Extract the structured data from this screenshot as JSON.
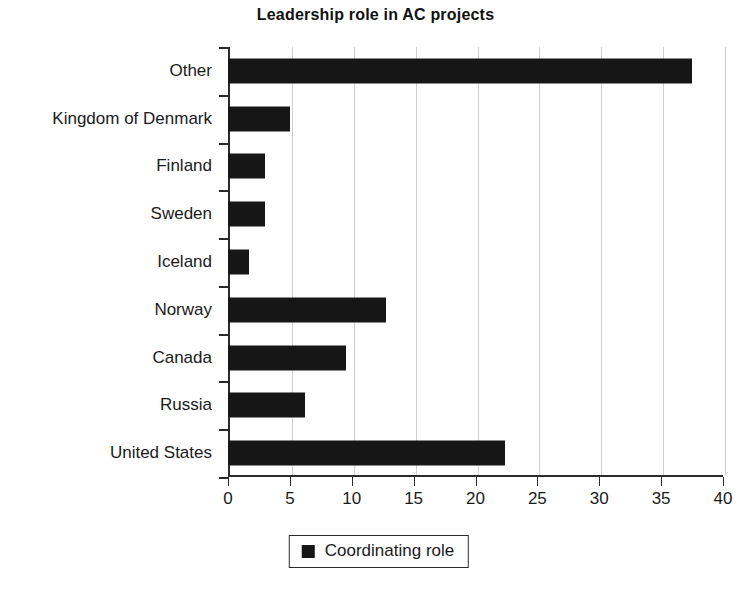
{
  "chart_data": {
    "type": "bar",
    "orientation": "horizontal",
    "title": "Leadership role in AC projects",
    "xlabel": "",
    "ylabel": "",
    "categories": [
      "Other",
      "Kingdom of Denmark",
      "Finland",
      "Sweden",
      "Iceland",
      "Norway",
      "Canada",
      "Russia",
      "United States"
    ],
    "values": [
      37.5,
      5.0,
      3.0,
      3.0,
      1.7,
      12.8,
      9.5,
      6.2,
      22.4
    ],
    "series": [
      {
        "name": "Coordinating role",
        "values": [
          37.5,
          5.0,
          3.0,
          3.0,
          1.7,
          12.8,
          9.5,
          6.2,
          22.4
        ],
        "color": "#161616"
      }
    ],
    "xlim": [
      0,
      40
    ],
    "xticks": [
      0,
      5,
      10,
      15,
      20,
      25,
      30,
      35,
      40
    ],
    "xtick_labels": [
      "0",
      "5",
      "10",
      "15",
      "20",
      "25",
      "30",
      "35",
      "40"
    ],
    "grid": true,
    "grid_axis": "x",
    "legend": {
      "position": "bottom-center",
      "entries": [
        {
          "label": "Coordinating role",
          "marker": "square",
          "color": "#161616"
        }
      ]
    },
    "colors": {
      "bar": "#161616",
      "axis": "#2b2b2b",
      "grid": "#cfcfcf",
      "text": "#1a1a1a",
      "background": "#ffffff"
    }
  }
}
